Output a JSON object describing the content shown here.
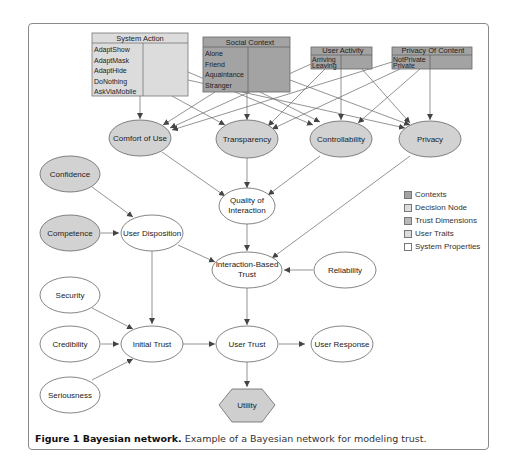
{
  "figure": {
    "caption_bold": "Figure 1 Bayesian network.",
    "caption_text": " Example of a Bayesian network for modeling trust."
  },
  "colors": {
    "contexts": "#a3a3a3",
    "decision_node": "#dcdcdc",
    "trust_dimensions": "#c8c8c8",
    "user_traits": "#dcdcdc",
    "system_properties": "#ffffff",
    "edge": "#555555",
    "border": "#6a6a6a"
  },
  "context_boxes": [
    {
      "id": "system-action",
      "title": "System Action",
      "states": [
        "AdaptShow",
        "AdaptMask",
        "AdaptHide",
        "DoNothing",
        "AskViaMobile"
      ],
      "kind": "decision_node"
    },
    {
      "id": "social-context",
      "title": "Social Context",
      "states": [
        "Alone",
        "Friend",
        "Aquaintance",
        "Stranger"
      ],
      "kind": "contexts"
    },
    {
      "id": "user-activity",
      "title": "User Activity",
      "states": [
        "Arriving",
        "Leaving"
      ],
      "kind": "contexts"
    },
    {
      "id": "privacy-of-content",
      "title": "Privacy Of Content",
      "states": [
        "NotPrivate",
        "Private"
      ],
      "kind": "contexts"
    }
  ],
  "nodes": {
    "comfort_of_use": "Comfort of Use",
    "transparency": "Transparency",
    "controllability": "Controllability",
    "privacy": "Privacy",
    "confidence": "Confidence",
    "competence": "Competence",
    "user_disposition": "User Disposition",
    "quality_of_interaction_line1": "Quality of",
    "quality_of_interaction_line2": "Interaction",
    "interaction_based_trust_line1": "Interaction-Based",
    "interaction_based_trust_line2": "Trust",
    "reliability": "Reliability",
    "security": "Security",
    "credibility": "Credibility",
    "seriousness": "Seriousness",
    "initial_trust": "Initial Trust",
    "user_trust": "User Trust",
    "user_response": "User Response",
    "utility": "Utility"
  },
  "legend": [
    {
      "label": "Contexts",
      "color": "#a3a3a3"
    },
    {
      "label": "Decision Node",
      "color": "#dcdcdc"
    },
    {
      "label": "Trust Dimensions",
      "color": "#b8b8b8"
    },
    {
      "label": "User Traits",
      "color": "#dcdcdc"
    },
    {
      "label": "System Properties",
      "color": "#ffffff"
    }
  ]
}
